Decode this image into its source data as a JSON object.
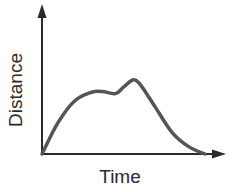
{
  "chart_data": {
    "type": "line",
    "title": "",
    "xlabel": "Time",
    "ylabel": "Distance",
    "grid": false,
    "legend": null,
    "ticks": {
      "x": [],
      "y": []
    },
    "x": [
      0,
      0.1,
      0.2,
      0.3,
      0.37,
      0.45,
      0.5,
      0.56,
      0.6,
      0.65,
      0.7,
      0.8,
      0.9,
      1.0
    ],
    "values": [
      0,
      0.3,
      0.5,
      0.58,
      0.59,
      0.57,
      0.63,
      0.7,
      0.66,
      0.55,
      0.43,
      0.2,
      0.07,
      0
    ],
    "xlim": [
      0,
      1.15
    ],
    "ylim": [
      0,
      1.0
    ],
    "line_color": "#555555",
    "axis_color": "#2a2a2a"
  }
}
